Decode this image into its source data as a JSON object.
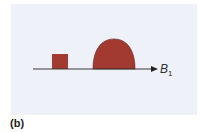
{
  "figure": {
    "panel_label": "(b)",
    "axis": {
      "label": "B",
      "subscript": "1"
    },
    "colors": {
      "background": "#eef1f7",
      "shape_fill": "#a23a32",
      "axis_line": "#3a3a3a"
    },
    "shapes": [
      {
        "type": "rectangle",
        "description": "small square block on axis"
      },
      {
        "type": "dome",
        "description": "large rounded hump on axis"
      }
    ]
  }
}
